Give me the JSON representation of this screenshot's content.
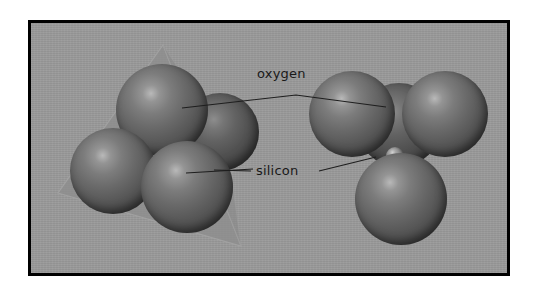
{
  "figure": {
    "kind": "scientific-illustration",
    "background_color": "#9a9a9a",
    "frame_color": "#000000",
    "sphere_color": "#5a5a5a",
    "tetrahedron_color": "#8c8c8c",
    "leader_line_color": "#1e1e1e"
  },
  "labels": {
    "oxygen": "oxygen",
    "silicon": "silicon"
  },
  "left_model": {
    "name": "space-filling tetrahedron with wireframe",
    "oxygen_count": 4,
    "tetrahedron_visible": true
  },
  "right_model": {
    "name": "exploded tetrahedron showing central silicon",
    "oxygen_count": 4,
    "silicon_count": 1
  }
}
